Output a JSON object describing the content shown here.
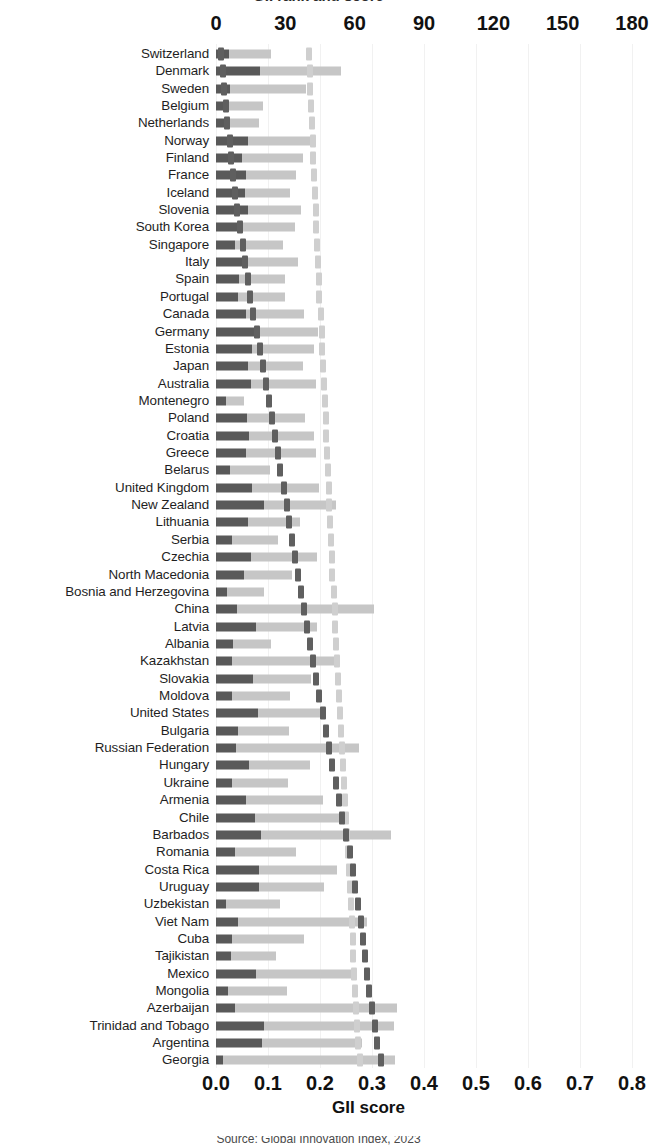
{
  "figure": {
    "title_partial": "GII rank and score",
    "caption_partial": "Source: Global Innovation Index, 2023",
    "bottom_axis_title": "GII score"
  },
  "axes": {
    "top": {
      "label": "GII rank",
      "ticks": [
        "0",
        "30",
        "60",
        "90",
        "120",
        "150",
        "180"
      ],
      "min": 0,
      "max": 180
    },
    "bottom": {
      "label": "GII score",
      "ticks": [
        "0.0",
        "0.1",
        "0.2",
        "0.3",
        "0.4",
        "0.5",
        "0.6",
        "0.7",
        "0.8"
      ],
      "min": 0.0,
      "max": 0.8
    }
  },
  "chart_data": {
    "type": "bar",
    "title": "GII rank and score",
    "xlabel": "GII score",
    "ylabel": "",
    "xlim": [
      0.0,
      0.8
    ],
    "secondary_xlim": [
      0,
      180
    ],
    "grid": true,
    "legend_position": "top",
    "series": [
      {
        "name": "Institutions score",
        "color": "#595959",
        "key": "dark"
      },
      {
        "name": "Infrastructure score",
        "color": "#c6c6c6",
        "key": "light"
      },
      {
        "name": "GII rank (dark dashed)",
        "color": "#5f5f5f",
        "key": "dash_dark"
      },
      {
        "name": "Trend (light dashed)",
        "color": "#cfcfcf",
        "key": "dash_light"
      }
    ],
    "categories": [
      "Switzerland",
      "Denmark",
      "Sweden",
      "Belgium",
      "Netherlands",
      "Norway",
      "Finland",
      "France",
      "Iceland",
      "Slovenia",
      "South Korea",
      "Singapore",
      "Italy",
      "Spain",
      "Portugal",
      "Canada",
      "Germany",
      "Estonia",
      "Japan",
      "Australia",
      "Montenegro",
      "Poland",
      "Croatia",
      "Greece",
      "Belarus",
      "United Kingdom",
      "New Zealand",
      "Lithuania",
      "Serbia",
      "Czechia",
      "North Macedonia",
      "Bosnia and Herzegovina",
      "China",
      "Latvia",
      "Albania",
      "Kazakhstan",
      "Slovakia",
      "Moldova",
      "United States",
      "Bulgaria",
      "Russian Federation",
      "Hungary",
      "Ukraine",
      "Armenia",
      "Chile",
      "Barbados",
      "Romania",
      "Costa Rica",
      "Uruguay",
      "Uzbekistan",
      "Viet Nam",
      "Cuba",
      "Tajikistan",
      "Mexico",
      "Mongolia",
      "Azerbaijan",
      "Trinidad and Tobago",
      "Argentina",
      "Georgia"
    ],
    "rows": [
      {
        "label": "Switzerland",
        "dark": 0.025,
        "light": 0.08,
        "dash_dark": 0.01,
        "dash_light": 0.178
      },
      {
        "label": "Denmark",
        "dark": 0.085,
        "light": 0.155,
        "dash_dark": 0.013,
        "dash_light": 0.18
      },
      {
        "label": "Sweden",
        "dark": 0.026,
        "light": 0.148,
        "dash_dark": 0.016,
        "dash_light": 0.181
      },
      {
        "label": "Belgium",
        "dark": 0.019,
        "light": 0.072,
        "dash_dark": 0.019,
        "dash_light": 0.183
      },
      {
        "label": "Netherlands",
        "dark": 0.018,
        "light": 0.065,
        "dash_dark": 0.022,
        "dash_light": 0.184
      },
      {
        "label": "Norway",
        "dark": 0.062,
        "light": 0.122,
        "dash_dark": 0.026,
        "dash_light": 0.186
      },
      {
        "label": "Finland",
        "dark": 0.05,
        "light": 0.118,
        "dash_dark": 0.029,
        "dash_light": 0.187
      },
      {
        "label": "France",
        "dark": 0.058,
        "light": 0.096,
        "dash_dark": 0.033,
        "dash_light": 0.189
      },
      {
        "label": "Iceland",
        "dark": 0.056,
        "light": 0.087,
        "dash_dark": 0.037,
        "dash_light": 0.19
      },
      {
        "label": "Slovenia",
        "dark": 0.061,
        "light": 0.102,
        "dash_dark": 0.041,
        "dash_light": 0.192
      },
      {
        "label": "South Korea",
        "dark": 0.052,
        "light": 0.1,
        "dash_dark": 0.046,
        "dash_light": 0.193
      },
      {
        "label": "Singapore",
        "dark": 0.037,
        "light": 0.092,
        "dash_dark": 0.051,
        "dash_light": 0.195
      },
      {
        "label": "Italy",
        "dark": 0.05,
        "light": 0.108,
        "dash_dark": 0.056,
        "dash_light": 0.196
      },
      {
        "label": "Spain",
        "dark": 0.045,
        "light": 0.088,
        "dash_dark": 0.061,
        "dash_light": 0.198
      },
      {
        "label": "Portugal",
        "dark": 0.042,
        "light": 0.09,
        "dash_dark": 0.066,
        "dash_light": 0.199
      },
      {
        "label": "Canada",
        "dark": 0.058,
        "light": 0.112,
        "dash_dark": 0.072,
        "dash_light": 0.201
      },
      {
        "label": "Germany",
        "dark": 0.076,
        "light": 0.12,
        "dash_dark": 0.078,
        "dash_light": 0.203
      },
      {
        "label": "Estonia",
        "dark": 0.07,
        "light": 0.118,
        "dash_dark": 0.084,
        "dash_light": 0.204
      },
      {
        "label": "Japan",
        "dark": 0.062,
        "light": 0.105,
        "dash_dark": 0.09,
        "dash_light": 0.206
      },
      {
        "label": "Australia",
        "dark": 0.068,
        "light": 0.125,
        "dash_dark": 0.096,
        "dash_light": 0.208
      },
      {
        "label": "Montenegro",
        "dark": 0.02,
        "light": 0.034,
        "dash_dark": 0.101,
        "dash_light": 0.209
      },
      {
        "label": "Poland",
        "dark": 0.06,
        "light": 0.112,
        "dash_dark": 0.107,
        "dash_light": 0.211
      },
      {
        "label": "Croatia",
        "dark": 0.063,
        "light": 0.126,
        "dash_dark": 0.113,
        "dash_light": 0.212
      },
      {
        "label": "Greece",
        "dark": 0.058,
        "light": 0.135,
        "dash_dark": 0.119,
        "dash_light": 0.214
      },
      {
        "label": "Belarus",
        "dark": 0.027,
        "light": 0.076,
        "dash_dark": 0.124,
        "dash_light": 0.215
      },
      {
        "label": "United Kingdom",
        "dark": 0.07,
        "light": 0.128,
        "dash_dark": 0.13,
        "dash_light": 0.217
      },
      {
        "label": "New Zealand",
        "dark": 0.092,
        "light": 0.138,
        "dash_dark": 0.136,
        "dash_light": 0.218
      },
      {
        "label": "Lithuania",
        "dark": 0.062,
        "light": 0.1,
        "dash_dark": 0.141,
        "dash_light": 0.22
      },
      {
        "label": "Serbia",
        "dark": 0.031,
        "light": 0.088,
        "dash_dark": 0.147,
        "dash_light": 0.221
      },
      {
        "label": "Czechia",
        "dark": 0.067,
        "light": 0.128,
        "dash_dark": 0.152,
        "dash_light": 0.223
      },
      {
        "label": "North Macedonia",
        "dark": 0.053,
        "light": 0.094,
        "dash_dark": 0.158,
        "dash_light": 0.224
      },
      {
        "label": "Bosnia and Herzegovina",
        "dark": 0.021,
        "light": 0.072,
        "dash_dark": 0.163,
        "dash_light": 0.226
      },
      {
        "label": "China",
        "dark": 0.04,
        "light": 0.264,
        "dash_dark": 0.169,
        "dash_light": 0.228
      },
      {
        "label": "Latvia",
        "dark": 0.076,
        "light": 0.118,
        "dash_dark": 0.175,
        "dash_light": 0.229
      },
      {
        "label": "Albania",
        "dark": 0.032,
        "light": 0.074,
        "dash_dark": 0.181,
        "dash_light": 0.231
      },
      {
        "label": "Kazakhstan",
        "dark": 0.03,
        "light": 0.205,
        "dash_dark": 0.187,
        "dash_light": 0.232
      },
      {
        "label": "Slovakia",
        "dark": 0.072,
        "light": 0.11,
        "dash_dark": 0.193,
        "dash_light": 0.234
      },
      {
        "label": "Moldova",
        "dark": 0.03,
        "light": 0.112,
        "dash_dark": 0.199,
        "dash_light": 0.236
      },
      {
        "label": "United States",
        "dark": 0.08,
        "light": 0.132,
        "dash_dark": 0.205,
        "dash_light": 0.238
      },
      {
        "label": "Bulgaria",
        "dark": 0.043,
        "light": 0.098,
        "dash_dark": 0.211,
        "dash_light": 0.24
      },
      {
        "label": "Russian Federation",
        "dark": 0.039,
        "light": 0.236,
        "dash_dark": 0.217,
        "dash_light": 0.242
      },
      {
        "label": "Hungary",
        "dark": 0.063,
        "light": 0.118,
        "dash_dark": 0.224,
        "dash_light": 0.244
      },
      {
        "label": "Ukraine",
        "dark": 0.03,
        "light": 0.108,
        "dash_dark": 0.23,
        "dash_light": 0.246
      },
      {
        "label": "Armenia",
        "dark": 0.058,
        "light": 0.148,
        "dash_dark": 0.237,
        "dash_light": 0.248
      },
      {
        "label": "Chile",
        "dark": 0.075,
        "light": 0.176,
        "dash_dark": 0.243,
        "dash_light": 0.25
      },
      {
        "label": "Barbados",
        "dark": 0.086,
        "light": 0.25,
        "dash_dark": 0.25,
        "dash_light": 0.252
      },
      {
        "label": "Romania",
        "dark": 0.036,
        "light": 0.118,
        "dash_dark": 0.257,
        "dash_light": 0.254
      },
      {
        "label": "Costa Rica",
        "dark": 0.082,
        "light": 0.15,
        "dash_dark": 0.263,
        "dash_light": 0.256
      },
      {
        "label": "Uruguay",
        "dark": 0.082,
        "light": 0.126,
        "dash_dark": 0.268,
        "dash_light": 0.258
      },
      {
        "label": "Uzbekistan",
        "dark": 0.02,
        "light": 0.104,
        "dash_dark": 0.273,
        "dash_light": 0.259
      },
      {
        "label": "Viet Nam",
        "dark": 0.042,
        "light": 0.248,
        "dash_dark": 0.278,
        "dash_light": 0.261
      },
      {
        "label": "Cuba",
        "dark": 0.03,
        "light": 0.14,
        "dash_dark": 0.283,
        "dash_light": 0.263
      },
      {
        "label": "Tajikistan",
        "dark": 0.028,
        "light": 0.088,
        "dash_dark": 0.287,
        "dash_light": 0.264
      },
      {
        "label": "Mexico",
        "dark": 0.076,
        "light": 0.186,
        "dash_dark": 0.291,
        "dash_light": 0.266
      },
      {
        "label": "Mongolia",
        "dark": 0.024,
        "light": 0.112,
        "dash_dark": 0.295,
        "dash_light": 0.267
      },
      {
        "label": "Azerbaijan",
        "dark": 0.036,
        "light": 0.312,
        "dash_dark": 0.3,
        "dash_light": 0.269
      },
      {
        "label": "Trinidad and Tobago",
        "dark": 0.092,
        "light": 0.25,
        "dash_dark": 0.305,
        "dash_light": 0.271
      },
      {
        "label": "Argentina",
        "dark": 0.088,
        "light": 0.192,
        "dash_dark": 0.31,
        "dash_light": 0.273
      },
      {
        "label": "Georgia",
        "dark": 0.014,
        "light": 0.33,
        "dash_dark": 0.318,
        "dash_light": 0.276
      }
    ]
  },
  "colors": {
    "bar_dark": "#595959",
    "bar_light": "#c6c6c6",
    "dash_dark": "#5f5f5f",
    "dash_light": "#cfcfcf",
    "gridline": "#f1f1f1",
    "text": "#1f1f1f",
    "background": "#ffffff"
  }
}
